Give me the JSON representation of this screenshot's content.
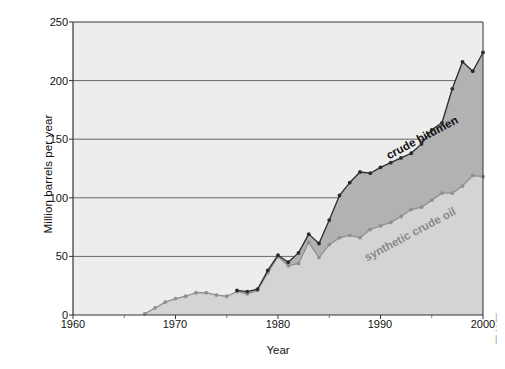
{
  "chart_data": {
    "type": "area",
    "title": "",
    "subtitle": "",
    "xlabel": "Year",
    "ylabel": "Million barrels per year",
    "xlim": [
      1960,
      2000
    ],
    "ylim": [
      0,
      250
    ],
    "xticks": [
      1960,
      1970,
      1980,
      1990,
      2000
    ],
    "yticks": [
      0,
      50,
      100,
      150,
      200,
      250
    ],
    "grid": "horizontal",
    "legend_position": "inline-annotations",
    "plot_background": "#ededed",
    "series": [
      {
        "name": "crude bitumen",
        "color": "#2b2b2b",
        "fill_color": "#b2b2b2",
        "marker": "circle",
        "x": [
          1976,
          1977,
          1978,
          1979,
          1980,
          1981,
          1982,
          1983,
          1984,
          1985,
          1986,
          1987,
          1988,
          1989,
          1990,
          1991,
          1992,
          1993,
          1994,
          1995,
          1996,
          1997,
          1998,
          1999,
          2000
        ],
        "values": [
          21,
          20,
          22,
          38,
          51,
          45,
          53,
          69,
          61,
          81,
          102,
          113,
          122,
          121,
          126,
          130,
          134,
          138,
          146,
          158,
          164,
          193,
          216,
          208,
          224
        ]
      },
      {
        "name": "synthetic crude oil",
        "color": "#8f8f8f",
        "fill_color": "#d4d4d4",
        "marker": "circle",
        "x": [
          1967,
          1968,
          1969,
          1970,
          1971,
          1972,
          1973,
          1974,
          1975,
          1976,
          1977,
          1978,
          1979,
          1980,
          1981,
          1982,
          1983,
          1984,
          1985,
          1986,
          1987,
          1988,
          1989,
          1990,
          1991,
          1992,
          1993,
          1994,
          1995,
          1996,
          1997,
          1998,
          1999,
          2000
        ],
        "values": [
          1,
          6,
          11,
          14,
          16,
          19,
          19,
          17,
          16,
          20,
          18,
          21,
          36,
          50,
          42,
          44,
          62,
          49,
          60,
          66,
          68,
          66,
          73,
          76,
          79,
          84,
          90,
          92,
          98,
          104,
          104,
          110,
          119,
          118
        ]
      }
    ],
    "annotations": [
      {
        "text": "crude bitumen",
        "x": 1990.6,
        "y": 135,
        "rotation": -28
      },
      {
        "text": "synthetic crude oil",
        "x": 1988.5,
        "y": 48,
        "rotation": -28
      }
    ]
  },
  "axes": {
    "y_title": "Million barrels per year",
    "x_title": "Year",
    "y_tick_labels": [
      "250",
      "200",
      "150",
      "100",
      "50",
      "0"
    ],
    "x_tick_labels": [
      "1960",
      "1970",
      "1980",
      "1990",
      "2000"
    ]
  },
  "labels": {
    "crude_bitumen": "crude bitumen",
    "synthetic_crude_oil": "synthetic crude oil"
  }
}
